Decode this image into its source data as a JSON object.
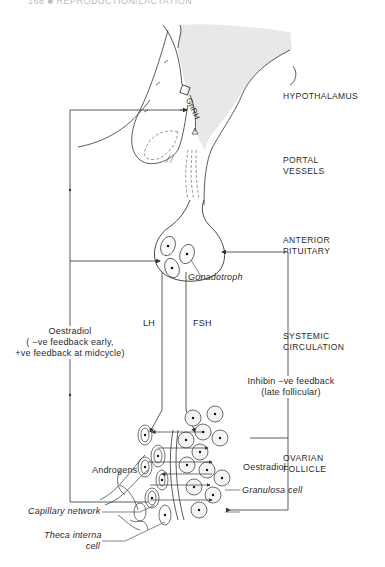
{
  "header": {
    "text": "168 ■ REPRODUCTION/LACTATION"
  },
  "regions": [
    {
      "id": "hypothalamus",
      "label": "HYPOTHALAMUS"
    },
    {
      "id": "portal",
      "label_line1": "PORTAL",
      "label_line2": "VESSELS"
    },
    {
      "id": "pituitary",
      "label_line1": "ANTERIOR",
      "label_line2": "PITUITARY"
    },
    {
      "id": "circulation",
      "label_line1": "SYSTEMIC",
      "label_line2": "CIRCULATION"
    },
    {
      "id": "follicle",
      "label_line1": "OVARIAN",
      "label_line2": "FOLLICLE"
    }
  ],
  "labels": {
    "gnrh": "GnRH",
    "gonadotroph": "Gonadotroph",
    "lh": "LH",
    "fsh": "FSH",
    "oestradiol_feedback": {
      "line1": "Oestradiol",
      "line2": "( −ve feedback early,",
      "line3": "+ve feedback at midcycle)"
    },
    "inhibin": {
      "line1": "Inhibin −ve feedback",
      "line2": "(late follicular)"
    },
    "androgens": "Androgens",
    "oestradiol": "Oestradiol",
    "granulosa": "Granulosa cell",
    "capillary": "Capillary network",
    "theca_line1": "Theca interna",
    "theca_line2": "cell"
  },
  "colors": {
    "line": "#333333",
    "shade": "#e6e6e6",
    "background": "#ffffff"
  }
}
